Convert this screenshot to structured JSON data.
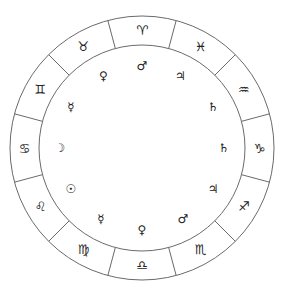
{
  "diagram": {
    "type": "zodiac-rulership-wheel",
    "center": [
      142,
      148
    ],
    "outer_radius": 132,
    "inner_radius": 103,
    "planet_radius": 82,
    "line_color": "#6a6a6a",
    "glyph_color": "#222222",
    "signs": [
      {
        "name": "aries",
        "glyph": "♈",
        "angle": 90
      },
      {
        "name": "taurus",
        "glyph": "♉",
        "angle": 120
      },
      {
        "name": "gemini",
        "glyph": "♊",
        "angle": 150
      },
      {
        "name": "cancer",
        "glyph": "♋",
        "angle": 180
      },
      {
        "name": "leo",
        "glyph": "♌",
        "angle": 210
      },
      {
        "name": "virgo",
        "glyph": "♍",
        "angle": 240
      },
      {
        "name": "libra",
        "glyph": "♎",
        "angle": 270
      },
      {
        "name": "scorpio",
        "glyph": "♏",
        "angle": 300
      },
      {
        "name": "sagittarius",
        "glyph": "♐",
        "angle": 330
      },
      {
        "name": "capricorn",
        "glyph": "♑",
        "angle": 0
      },
      {
        "name": "aquarius",
        "glyph": "♒",
        "angle": 30
      },
      {
        "name": "pisces",
        "glyph": "♓",
        "angle": 60
      }
    ],
    "rulers": [
      {
        "sign": "aries",
        "planet": "mars",
        "glyph": "♂",
        "angle": 90
      },
      {
        "sign": "taurus",
        "planet": "venus",
        "glyph": "♀",
        "angle": 118
      },
      {
        "sign": "gemini",
        "planet": "mercury",
        "glyph": "☿",
        "angle": 150
      },
      {
        "sign": "cancer",
        "planet": "moon",
        "glyph": "☽",
        "angle": 180
      },
      {
        "sign": "leo",
        "planet": "sun",
        "glyph": "☉",
        "angle": 210
      },
      {
        "sign": "virgo",
        "planet": "mercury",
        "glyph": "☿",
        "angle": 240
      },
      {
        "sign": "libra",
        "planet": "venus",
        "glyph": "♀",
        "angle": 270
      },
      {
        "sign": "scorpio",
        "planet": "mars",
        "glyph": "♂",
        "angle": 300
      },
      {
        "sign": "sagittarius",
        "planet": "jupiter",
        "glyph": "♃",
        "angle": 330
      },
      {
        "sign": "capricorn",
        "planet": "saturn",
        "glyph": "♄",
        "angle": 0
      },
      {
        "sign": "aquarius",
        "planet": "saturn",
        "glyph": "♄",
        "angle": 30
      },
      {
        "sign": "pisces",
        "planet": "jupiter",
        "glyph": "♃",
        "angle": 62
      }
    ]
  }
}
